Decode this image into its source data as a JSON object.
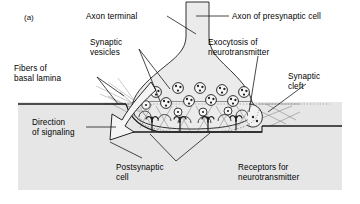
{
  "figure": {
    "panel_label": "(a)",
    "type": "chemical-synapse-diagram",
    "background_color": "#ffffff",
    "panel_fill": "#e6e6e6",
    "line_color": "#1a1a1a"
  },
  "labels": {
    "axon_terminal": "Axon terminal",
    "axon_presynaptic": "Axon of presynaptic cell",
    "synaptic_vesicles": "Synaptic\nvesicles",
    "exocytosis": "Exocytosis of\nneurotransmitter",
    "fibers_basal_lamina": "Fibers of\nbasal lamina",
    "synaptic_cleft": "Synaptic\ncleft",
    "direction_of_signaling": "Direction\nof signaling",
    "postsynaptic_cell": "Postsynaptic\ncell",
    "receptors": "Receptors for\nneurotransmitter"
  },
  "structures": {
    "vesicle_count": 13,
    "receptor_count": 4,
    "vesicle_dots_each": 3,
    "signal_arrow": "hollow-curved-arrow-downward",
    "cleft_fill": "#f2f2f2",
    "terminal_fill": "#ebebeb"
  }
}
